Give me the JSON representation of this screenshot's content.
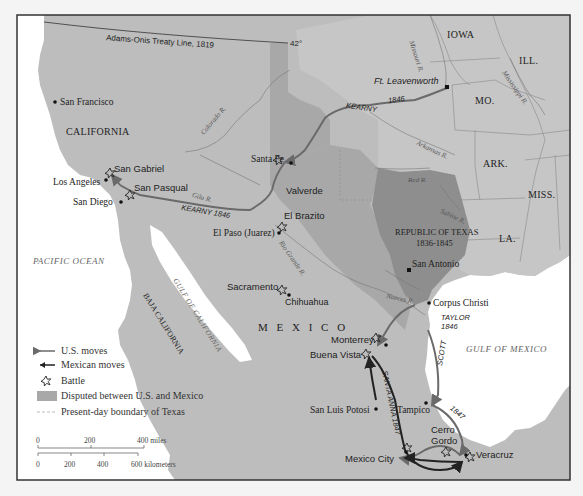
{
  "map": {
    "title": "Mexican-American War, 1846-1848",
    "colors": {
      "background": "#f4f4f4",
      "land": "#bdbdbd",
      "us_territory": "#c4c4c4",
      "disputed": "#a8a8a8",
      "republic_of_texas": "#8e8e8e",
      "water": "#ffffff",
      "frame": "#333333",
      "us_move": "#6a6a6a",
      "mexican_move": "#222222"
    },
    "lines": {
      "treaty_line": "Adams-Onis Treaty Line, 1819",
      "parallel": "42°"
    },
    "states": {
      "iowa": "IOWA",
      "ill": "ILL.",
      "mo": "MO.",
      "ark": "ARK.",
      "miss": "MISS.",
      "la": "LA.",
      "california": "CALIFORNIA",
      "mexico": "M E X I C O",
      "baja": "BAJA CALIFORNIA",
      "texas": "REPUBLIC OF TEXAS",
      "texas_years": "1836-1845"
    },
    "water": {
      "pacific": "PACIFIC OCEAN",
      "gulf_mexico": "GULF OF MEXICO",
      "gulf_california": "GULF OF CALIFORNIA"
    },
    "rivers": {
      "missouri": "Missouri R.",
      "mississippi": "Mississippi R.",
      "arkansas": "Arkansas R.",
      "red": "Red R.",
      "sabine": "Sabine R.",
      "colorado": "Colorado R.",
      "gila": "Gila R.",
      "rio_grande": "Rio Grande R.",
      "nueces": "Nueces R."
    },
    "cities": {
      "san_francisco": "San Francisco",
      "los_angeles": "Los Angeles",
      "san_diego": "San Diego",
      "santa_fe": "Santa Fe",
      "el_paso": "El Paso (Juarez)",
      "chihuahua": "Chihuahua",
      "san_antonio": "San Antonio",
      "corpus_christi": "Corpus Christi",
      "san_luis_potosi": "San Luis Potosi",
      "tampico": "Tampico",
      "ft_leavenworth": "Ft. Leavenworth"
    },
    "battles": {
      "san_gabriel": "San Gabriel",
      "san_pasqual": "San Pasqual",
      "valverde": "Valverde",
      "el_brazito": "El Brazito",
      "sacramento": "Sacramento",
      "monterrey": "Monterrey",
      "buena_vista": "Buena Vista",
      "cerro_gordo_1": "Cerro",
      "cerro_gordo_2": "Gordo",
      "mexico_city": "Mexico City",
      "veracruz": "Veracruz"
    },
    "routes": {
      "kearny_top": "KEARNY",
      "kearny_top_year": "1846",
      "kearny_west": "KEARNY 1846",
      "taylor": "TAYLOR",
      "taylor_year": "1846",
      "scott": "SCOTT",
      "scott_year": "1847",
      "santa_anna": "SANTA ANNA 1847"
    }
  },
  "legend": {
    "items": [
      {
        "symbol": "gray-arrow",
        "label": "U.S. moves"
      },
      {
        "symbol": "black-arrow",
        "label": "Mexican moves"
      },
      {
        "symbol": "battle-star",
        "label": "Battle"
      },
      {
        "symbol": "gray-swatch",
        "label": "Disputed between U.S. and Mexico"
      },
      {
        "symbol": "dashed-line",
        "label": "Present-day boundary of Texas"
      }
    ]
  },
  "scale": {
    "miles": {
      "ticks": [
        "0",
        "200",
        "400 miles"
      ]
    },
    "km": {
      "ticks": [
        "0",
        "200",
        "400",
        "600 kilometers"
      ]
    }
  }
}
